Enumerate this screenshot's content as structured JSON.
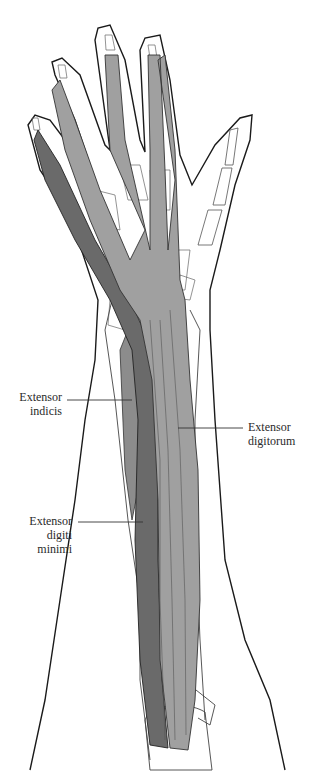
{
  "figure": {
    "colors": {
      "outline": "#1a1a1a",
      "bone": "#ffffff",
      "bone_line": "#555555",
      "extensor_digitorum": "#a0a0a0",
      "extensor_digiti_minimi": "#6a6a6a",
      "extensor_indicis": "#8c8c8c",
      "leader_line": "#333333"
    }
  },
  "labels": [
    {
      "id": "extensor-indicis",
      "line1": "Extensor",
      "line2": "indicis"
    },
    {
      "id": "extensor-digitorum",
      "line1": "Extensor",
      "line2": "digitorum"
    },
    {
      "id": "extensor-digiti-minimi",
      "line1": "Extensor",
      "line2": "digiti",
      "line3": "minimi"
    }
  ]
}
